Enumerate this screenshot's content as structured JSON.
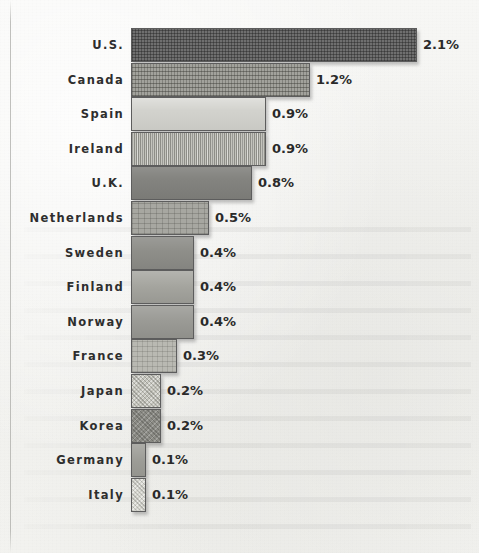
{
  "chart_data": {
    "type": "bar",
    "orientation": "horizontal",
    "title": "",
    "subtitle": "",
    "xlabel": "",
    "ylabel": "",
    "grid": false,
    "legend": false,
    "value_suffix": "%",
    "xlim": [
      0,
      2.1
    ],
    "categories": [
      "U.S.",
      "Canada",
      "Spain",
      "Ireland",
      "U.K.",
      "Netherlands",
      "Sweden",
      "Finland",
      "Norway",
      "France",
      "Japan",
      "Korea",
      "Germany",
      "Italy"
    ],
    "values": [
      2.1,
      1.2,
      0.9,
      0.9,
      0.8,
      0.5,
      0.4,
      0.4,
      0.4,
      0.3,
      0.2,
      0.2,
      0.1,
      0.1
    ],
    "value_labels": [
      "2.1%",
      "1.2%",
      "0.9%",
      "0.9%",
      "0.8%",
      "0.5%",
      "0.4%",
      "0.4%",
      "0.4%",
      "0.3%",
      "0.2%",
      "0.2%",
      "0.1%",
      "0.1%"
    ],
    "bars": [
      {
        "category": "U.S.",
        "value": 2.1,
        "label": "2.1%",
        "bar_px": 286,
        "fill": "f-darkcross",
        "color": "#6f6f6f"
      },
      {
        "category": "Canada",
        "value": 1.2,
        "label": "1.2%",
        "bar_px": 179,
        "fill": "f-midcross",
        "color": "#a2a29c"
      },
      {
        "category": "Spain",
        "value": 0.9,
        "label": "0.9%",
        "bar_px": 135,
        "fill": "f-lightsolid",
        "color": "#d2d2cd"
      },
      {
        "category": "Ireland",
        "value": 0.9,
        "label": "0.9%",
        "bar_px": 135,
        "fill": "f-lightvert",
        "color": "#c4c4bd"
      },
      {
        "category": "U.K.",
        "value": 0.8,
        "label": "0.8%",
        "bar_px": 121,
        "fill": "f-darksolid",
        "color": "#848480"
      },
      {
        "category": "Netherlands",
        "value": 0.5,
        "label": "0.5%",
        "bar_px": 78,
        "fill": "f-midgrid",
        "color": "#a7a7a1"
      },
      {
        "category": "Sweden",
        "value": 0.4,
        "label": "0.4%",
        "bar_px": 63,
        "fill": "f-midsolid",
        "color": "#8e8e89"
      },
      {
        "category": "Finland",
        "value": 0.4,
        "label": "0.4%",
        "bar_px": 63,
        "fill": "f-midlight",
        "color": "#a4a49e"
      },
      {
        "category": "Norway",
        "value": 0.4,
        "label": "0.4%",
        "bar_px": 63,
        "fill": "f-midlight2",
        "color": "#9a9a95"
      },
      {
        "category": "France",
        "value": 0.3,
        "label": "0.3%",
        "bar_px": 46,
        "fill": "f-lightgrid",
        "color": "#b9b9b2"
      },
      {
        "category": "Japan",
        "value": 0.2,
        "label": "0.2%",
        "bar_px": 30,
        "fill": "f-speckle",
        "color": "#c3c3bb"
      },
      {
        "category": "Korea",
        "value": 0.2,
        "label": "0.2%",
        "bar_px": 30,
        "fill": "f-darkspeck",
        "color": "#8a8a84"
      },
      {
        "category": "Germany",
        "value": 0.1,
        "label": "0.1%",
        "bar_px": 15,
        "fill": "f-plainmid",
        "color": "#9d9d97"
      },
      {
        "category": "Italy",
        "value": 0.1,
        "label": "0.1%",
        "bar_px": 15,
        "fill": "f-lightspeck",
        "color": "#d4d4cd"
      }
    ],
    "style": {
      "background": "#f3f3f1",
      "bar_border": "#5d5d5d",
      "label_color": "#2e2e2e",
      "value_color": "#2a2a2a"
    },
    "layout": {
      "bar_left_px": 131,
      "bar_height_px": 34,
      "row_pitch_px": 34.6,
      "first_row_top_px": 28,
      "label_gap_px": 6
    }
  }
}
